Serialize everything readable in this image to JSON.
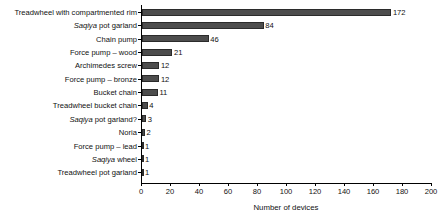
{
  "chart_data": {
    "type": "bar",
    "orientation": "horizontal",
    "title": "",
    "xlabel": "Number of devices",
    "ylabel": "",
    "xlim": [
      0,
      200
    ],
    "xticks": [
      0,
      20,
      40,
      60,
      80,
      100,
      120,
      140,
      160,
      180,
      200
    ],
    "grid": false,
    "legend": null,
    "bar_color": "#4d4d4d",
    "categories": [
      "Treadwheel with compartmented rim",
      "Saqiya pot garland",
      "Chain pump",
      "Force pump – wood",
      "Archimedes screw",
      "Force pump – bronze",
      "Bucket chain",
      "Treadwheel bucket chain",
      "Saqiya pot garland?",
      "Noria",
      "Force pump – lead",
      "Saqiya wheel",
      "Treadwheel pot garland"
    ],
    "values": [
      172,
      84,
      46,
      21,
      12,
      12,
      11,
      4,
      3,
      2,
      1,
      1,
      1
    ],
    "data_labels": [
      "172",
      "84",
      "46",
      "21",
      "12",
      "12",
      "11",
      "4",
      "3",
      "2",
      "1",
      "1",
      "1"
    ],
    "italic_prefix": {
      "1": "Saqiya",
      "8": "Saqiya",
      "11": "Saqiya"
    }
  }
}
